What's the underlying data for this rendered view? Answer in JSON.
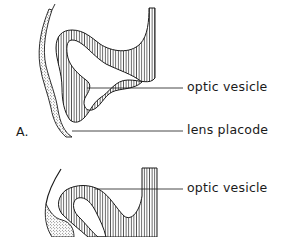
{
  "figure": {
    "panel_label": "A.",
    "top_diagram": {
      "labels": [
        {
          "text": "optic vesicle"
        },
        {
          "text": "lens placode"
        }
      ]
    },
    "bottom_diagram": {
      "labels": [
        {
          "text": "optic vesicle"
        }
      ]
    }
  },
  "colors": {
    "ink": "#1a1a1a",
    "background": "#ffffff"
  }
}
